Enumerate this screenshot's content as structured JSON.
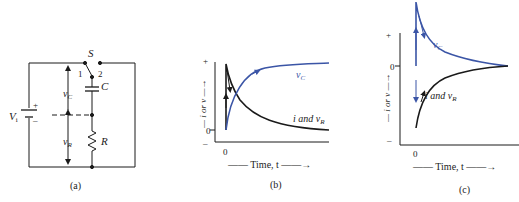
{
  "figure": {
    "panels": [
      {
        "id": "a",
        "caption": "(a)",
        "type": "circuit",
        "components": {
          "source_label": "V",
          "source_subscript": "i",
          "source_plus": "+",
          "source_minus": "–",
          "switch_label": "S",
          "switch_pos1": "1",
          "switch_pos2": "2",
          "capacitor_label": "C",
          "resistor_label": "R",
          "vc_label": "v",
          "vc_subscript": "C",
          "vr_label": "v",
          "vr_subscript": "R"
        }
      },
      {
        "id": "b",
        "caption": "(b)",
        "ylabel": "— i or v —→",
        "y_plus": "+",
        "y_zero": "0",
        "y_minus": "–",
        "x_zero": "0",
        "xlabel": "—— Time, t ——→",
        "curve1_label": "v",
        "curve1_sub": "C",
        "curve2_label": "i and v",
        "curve2_sub": "R"
      },
      {
        "id": "c",
        "caption": "(c)",
        "ylabel": "— i or v —→",
        "y_plus": "+",
        "y_zero": "0",
        "y_minus": "–",
        "x_zero": "0",
        "xlabel": "—— Time, t ——→",
        "curve1_label": "v",
        "curve1_sub": "C",
        "curve2_label": "i and v",
        "curve2_sub": "R"
      }
    ],
    "colors": {
      "line": "#1a1a1a",
      "vc_curve": "#3b55a6",
      "ir_curve": "#1a1a1a",
      "text": "#222222"
    }
  }
}
